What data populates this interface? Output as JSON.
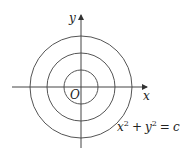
{
  "diagram": {
    "type": "level-curves",
    "axes": {
      "x_label": "x",
      "y_label": "y",
      "origin_label": "O"
    },
    "circles": [
      {
        "name": "inner",
        "radius_px": 17
      },
      {
        "name": "middle",
        "radius_px": 34
      },
      {
        "name": "outer",
        "radius_px": 51
      }
    ],
    "equation": {
      "x_base": "x",
      "x_exp": "2",
      "plus": "+",
      "y_base": "y",
      "y_exp": "2",
      "equals": "=",
      "rhs": "c"
    },
    "colors": {
      "stroke": "#555555",
      "text": "#222222"
    }
  }
}
